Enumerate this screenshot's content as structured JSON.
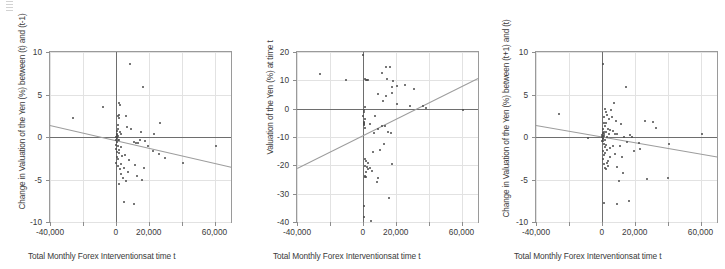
{
  "figure": {
    "background": "#ffffff",
    "marker_color": "#4a4a4a",
    "trendline_color": "#9d9d9d",
    "axis_color": "#6e6e6e",
    "grid_color": "#e2e2e2",
    "frame_color": "#9a9a9a"
  },
  "chart_data": [
    {
      "type": "scatter",
      "panel": 1,
      "title": "",
      "xlabel": "Total Monthly Forex Interventionsat time t",
      "ylabel": "Change in Valuation of the Yen (%) between (t) and (t-1)",
      "xlim": [
        -40000,
        70000
      ],
      "ylim": [
        -10,
        10
      ],
      "xticks": [
        -40000,
        -20000,
        0,
        20000,
        40000,
        60000
      ],
      "xticklabels": [
        "-40,000",
        "",
        "0",
        "20,000",
        "",
        "60,000"
      ],
      "yticks": [
        -10,
        -5,
        0,
        5,
        10
      ],
      "yticklabels": [
        "-10",
        "-5",
        "0",
        "5",
        "10"
      ],
      "grid": true,
      "legend": "none",
      "trendline": {
        "x0": -40000,
        "y0": 1.45,
        "x1": 70000,
        "y1": -3.45,
        "slope_sign": "negative"
      },
      "points": [
        [
          8500,
          8.6
        ],
        [
          16500,
          5.9
        ],
        [
          2000,
          4.0
        ],
        [
          2300,
          3.8
        ],
        [
          -7500,
          3.5
        ],
        [
          1800,
          2.6
        ],
        [
          2200,
          2.2
        ],
        [
          1500,
          2.5
        ],
        [
          -26000,
          2.2
        ],
        [
          6200,
          2.5
        ],
        [
          27000,
          1.7
        ],
        [
          1200,
          1.4
        ],
        [
          7000,
          1.2
        ],
        [
          1600,
          1.0
        ],
        [
          9500,
          0.9
        ],
        [
          700,
          0.7
        ],
        [
          2600,
          0.6
        ],
        [
          15500,
          0.6
        ],
        [
          1000,
          0.4
        ],
        [
          3400,
          0.3
        ],
        [
          23000,
          0.3
        ],
        [
          900,
          0.2
        ],
        [
          1400,
          0.1
        ],
        [
          400,
          0.05
        ],
        [
          600,
          -0.05
        ],
        [
          800,
          -0.15
        ],
        [
          1100,
          -0.3
        ],
        [
          300,
          -0.35
        ],
        [
          1900,
          -0.4
        ],
        [
          14500,
          -0.4
        ],
        [
          17500,
          -0.5
        ],
        [
          500,
          -0.55
        ],
        [
          11000,
          -0.6
        ],
        [
          12500,
          -0.7
        ],
        [
          13500,
          -0.75
        ],
        [
          200,
          -0.9
        ],
        [
          1300,
          -1.0
        ],
        [
          19500,
          -1.1
        ],
        [
          61000,
          -1.1
        ],
        [
          3000,
          -1.2
        ],
        [
          100,
          -1.4
        ],
        [
          2100,
          -1.5
        ],
        [
          22500,
          -1.6
        ],
        [
          900,
          -1.8
        ],
        [
          1700,
          -1.9
        ],
        [
          26000,
          -2.0
        ],
        [
          5500,
          -2.1
        ],
        [
          3800,
          -2.2
        ],
        [
          600,
          -2.4
        ],
        [
          30000,
          -2.5
        ],
        [
          1200,
          -2.6
        ],
        [
          8000,
          -2.7
        ],
        [
          41000,
          -3.0
        ],
        [
          400,
          -3.1
        ],
        [
          2900,
          -3.2
        ],
        [
          11500,
          -3.3
        ],
        [
          1500,
          -3.4
        ],
        [
          5000,
          -3.6
        ],
        [
          17000,
          -3.7
        ],
        [
          2400,
          -3.8
        ],
        [
          7500,
          -4.1
        ],
        [
          3200,
          -4.3
        ],
        [
          13000,
          -4.6
        ],
        [
          4200,
          -4.8
        ],
        [
          16000,
          -5.0
        ],
        [
          6000,
          -5.2
        ],
        [
          1800,
          -5.5
        ],
        [
          4800,
          -7.6
        ],
        [
          11000,
          -7.9
        ]
      ]
    },
    {
      "type": "scatter",
      "panel": 2,
      "title": "",
      "xlabel": "Total Monthly Forex Interventionsat time t",
      "ylabel": "Valuation of the Yen (%) at time t",
      "xlim": [
        -40000,
        70000
      ],
      "ylim": [
        -40,
        20
      ],
      "xticks": [
        -40000,
        -20000,
        0,
        20000,
        40000,
        60000
      ],
      "xticklabels": [
        "-40,000",
        "",
        "0",
        "20,000",
        "",
        "60,000"
      ],
      "yticks": [
        -40,
        -30,
        -20,
        -10,
        0,
        10,
        20
      ],
      "yticklabels": [
        "-40",
        "-30",
        "-20",
        "-10",
        "0",
        "10",
        "20"
      ],
      "grid": true,
      "legend": "none",
      "trendline": {
        "x0": -40000,
        "y0": -20.8,
        "x1": 70000,
        "y1": 11.0,
        "slope_sign": "positive"
      },
      "points": [
        [
          300,
          19.0
        ],
        [
          14000,
          14.8
        ],
        [
          16500,
          14.6
        ],
        [
          11500,
          12.5
        ],
        [
          -26000,
          12.2
        ],
        [
          1500,
          10.4
        ],
        [
          2200,
          10.2
        ],
        [
          2600,
          10.1
        ],
        [
          3100,
          10.0
        ],
        [
          -10500,
          10.1
        ],
        [
          14500,
          10.5
        ],
        [
          18500,
          9.7
        ],
        [
          25500,
          8.2
        ],
        [
          20500,
          7.9
        ],
        [
          17500,
          7.8
        ],
        [
          31000,
          6.8
        ],
        [
          18000,
          5.7
        ],
        [
          9500,
          5.3
        ],
        [
          14000,
          4.4
        ],
        [
          12500,
          2.6
        ],
        [
          21000,
          1.5
        ],
        [
          28500,
          0.9
        ],
        [
          36500,
          1.0
        ],
        [
          38500,
          0.4
        ],
        [
          1200,
          0.6
        ],
        [
          900,
          -0.4
        ],
        [
          61000,
          -0.4
        ],
        [
          600,
          -1.2
        ],
        [
          400,
          -2.6
        ],
        [
          7500,
          -2.5
        ],
        [
          1100,
          -3.8
        ],
        [
          800,
          -4.6
        ],
        [
          500,
          -5.0
        ],
        [
          700,
          -5.4
        ],
        [
          1000,
          -5.6
        ],
        [
          4200,
          -5.3
        ],
        [
          11500,
          -6.1
        ],
        [
          13500,
          -6.2
        ],
        [
          9000,
          -7.3
        ],
        [
          1300,
          -6.8
        ],
        [
          6500,
          -8.5
        ],
        [
          15000,
          -8.1
        ],
        [
          17000,
          -8.5
        ],
        [
          13000,
          -12.6
        ],
        [
          10500,
          -14.5
        ],
        [
          6000,
          -15.3
        ],
        [
          1400,
          -17.8
        ],
        [
          2000,
          -18.3
        ],
        [
          3200,
          -19.1
        ],
        [
          17500,
          -19.6
        ],
        [
          1600,
          -20.2
        ],
        [
          2400,
          -20.6
        ],
        [
          3400,
          -21.2
        ],
        [
          4200,
          -21.0
        ],
        [
          1900,
          -22.2
        ],
        [
          5500,
          -22.0
        ],
        [
          1200,
          -23.6
        ],
        [
          1500,
          -24.0
        ],
        [
          1700,
          -24.2
        ],
        [
          8500,
          -26.0
        ],
        [
          9500,
          -24.3
        ],
        [
          16000,
          -31.5
        ],
        [
          800,
          -34.2
        ],
        [
          600,
          -38.2
        ],
        [
          5000,
          -39.6
        ]
      ]
    },
    {
      "type": "scatter",
      "panel": 3,
      "title": "",
      "xlabel": "Total Monthly Forex Interventionsat time t",
      "ylabel": "Change in Valuation of the Yen (%) between (t+1) and (t)",
      "xlim": [
        -40000,
        70000
      ],
      "ylim": [
        -10,
        10
      ],
      "xticks": [
        -40000,
        -20000,
        0,
        20000,
        40000,
        60000
      ],
      "xticklabels": [
        "-40,000",
        "",
        "0",
        "20,000",
        "",
        "60,000"
      ],
      "yticks": [
        -10,
        -5,
        0,
        5,
        10
      ],
      "yticklabels": [
        "-10",
        "-5",
        "0",
        "5",
        "10"
      ],
      "grid": true,
      "legend": "none",
      "trendline": {
        "x0": -40000,
        "y0": 1.4,
        "x1": 70000,
        "y1": -2.3,
        "slope_sign": "negative"
      },
      "points": [
        [
          1000,
          8.6
        ],
        [
          14500,
          5.9
        ],
        [
          7500,
          4.0
        ],
        [
          2100,
          3.3
        ],
        [
          5500,
          3.2
        ],
        [
          2600,
          2.9
        ],
        [
          -26000,
          2.7
        ],
        [
          3400,
          2.6
        ],
        [
          6000,
          2.4
        ],
        [
          1500,
          2.3
        ],
        [
          4500,
          2.1
        ],
        [
          8500,
          1.9
        ],
        [
          26000,
          1.9
        ],
        [
          31000,
          1.8
        ],
        [
          1200,
          1.7
        ],
        [
          2800,
          1.6
        ],
        [
          11500,
          1.5
        ],
        [
          1800,
          1.3
        ],
        [
          33000,
          1.1
        ],
        [
          3800,
          1.0
        ],
        [
          900,
          0.9
        ],
        [
          5000,
          0.8
        ],
        [
          7000,
          0.7
        ],
        [
          1100,
          0.6
        ],
        [
          2300,
          0.55
        ],
        [
          600,
          0.45
        ],
        [
          4200,
          0.4
        ],
        [
          8000,
          0.35
        ],
        [
          1400,
          0.3
        ],
        [
          400,
          0.25
        ],
        [
          9500,
          0.3
        ],
        [
          17000,
          0.2
        ],
        [
          61000,
          0.4
        ],
        [
          700,
          0.15
        ],
        [
          1600,
          0.1
        ],
        [
          200,
          0.05
        ],
        [
          3000,
          0.0
        ],
        [
          13500,
          0.0
        ],
        [
          18500,
          -0.05
        ],
        [
          -8500,
          -0.1
        ],
        [
          500,
          -0.15
        ],
        [
          1000,
          -0.25
        ],
        [
          2000,
          -0.35
        ],
        [
          800,
          -0.45
        ],
        [
          300,
          -0.5
        ],
        [
          15500,
          -0.6
        ],
        [
          22500,
          -0.7
        ],
        [
          41000,
          -0.8
        ],
        [
          1300,
          -0.85
        ],
        [
          2500,
          -0.9
        ],
        [
          6500,
          -1.0
        ],
        [
          11000,
          -1.1
        ],
        [
          1700,
          -1.2
        ],
        [
          4800,
          -1.3
        ],
        [
          23500,
          -1.4
        ],
        [
          3200,
          -1.5
        ],
        [
          900,
          -1.6
        ],
        [
          19500,
          -1.7
        ],
        [
          2200,
          -1.9
        ],
        [
          7800,
          -2.0
        ],
        [
          1500,
          -2.1
        ],
        [
          5200,
          -2.3
        ],
        [
          12500,
          -2.4
        ],
        [
          600,
          -2.6
        ],
        [
          3600,
          -2.8
        ],
        [
          2900,
          -3.0
        ],
        [
          1200,
          -3.2
        ],
        [
          4000,
          -3.4
        ],
        [
          9000,
          -3.5
        ],
        [
          1900,
          -3.6
        ],
        [
          2400,
          -3.8
        ],
        [
          13000,
          -4.2
        ],
        [
          10500,
          -5.2
        ],
        [
          40500,
          -4.8
        ],
        [
          27500,
          -4.9
        ],
        [
          1600,
          -7.8
        ],
        [
          16500,
          -7.5
        ],
        [
          9500,
          -7.9
        ]
      ]
    }
  ]
}
